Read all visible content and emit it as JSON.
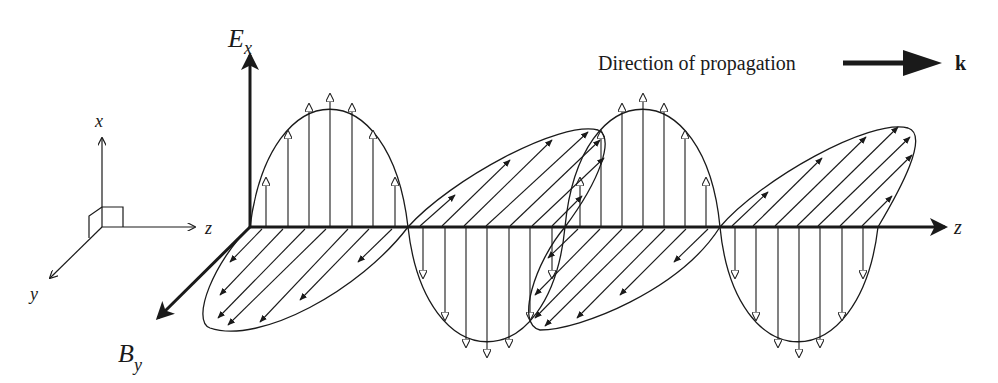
{
  "diagram": {
    "type": "electromagnetic-wave",
    "labels": {
      "e_field": "E",
      "e_field_sub": "x",
      "b_field": "B",
      "b_field_sub": "y",
      "z_axis_main": "z",
      "propagation_text": "Direction of propagation",
      "wave_vector": "k"
    },
    "reference_axes": {
      "x": "x",
      "y": "y",
      "z": "z"
    },
    "colors": {
      "ink": "#1a1a1a",
      "background": "#ffffff"
    },
    "wave": {
      "e_field_half_cycles": 4,
      "e_field_plane": "vertical (x)",
      "b_field_plane": "horizontal (y), drawn in perspective",
      "arrow_style_e": "open triangle heads",
      "arrow_style_b": "filled triangle heads"
    }
  }
}
